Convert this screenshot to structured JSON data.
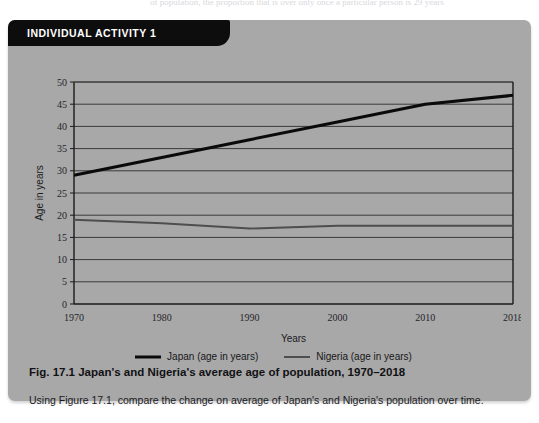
{
  "page": {
    "bleed_text": "of population, the proportion that is over only once a particular person is 29 years"
  },
  "activity": {
    "banner_label": "INDIVIDUAL ACTIVITY 1",
    "caption": "Fig. 17.1 Japan's and Nigeria's average age of population, 1970–2018",
    "instruction": "Using Figure 17.1, compare the change on average of Japan's and Nigeria's population over time."
  },
  "colors": {
    "card_bg": "#a8a8a8",
    "banner_bg": "#0d0d0d",
    "banner_text": "#ffffff",
    "plot_bg": "#a8a8a8",
    "axis_line": "#1a1a1a",
    "gridline": "#3a3a3a",
    "japan_line": "#0a0a0a",
    "nigeria_line": "#4e4e4e",
    "text": "#1b1b1f"
  },
  "chart_data": {
    "type": "line",
    "title": "Fig. 17.1 Japan's and Nigeria's average age of population, 1970–2018",
    "xlabel": "Years",
    "ylabel": "Age in years",
    "x": [
      1970,
      1980,
      1990,
      2000,
      2010,
      2018
    ],
    "categories": [
      "1970",
      "1980",
      "1990",
      "2000",
      "2010",
      "2018"
    ],
    "xtick_labels": [
      "1970",
      "1980",
      "1990",
      "2000",
      "2010",
      "2018"
    ],
    "ytick_labels": [
      "0",
      "5",
      "10",
      "15",
      "20",
      "25",
      "30",
      "35",
      "40",
      "45",
      "50"
    ],
    "yticks": [
      0,
      5,
      10,
      15,
      20,
      25,
      30,
      35,
      40,
      45,
      50
    ],
    "ylim": [
      0,
      50
    ],
    "grid": true,
    "legend_position": "bottom",
    "series": [
      {
        "name": "Japan (age in years)",
        "legend_label": "Japan (age in years)",
        "color": "#0a0a0a",
        "line_width": 3,
        "values": [
          29,
          33,
          37,
          41,
          45,
          47
        ]
      },
      {
        "name": "Nigeria (age in years)",
        "legend_label": "Nigeria (age in years)",
        "color": "#4e4e4e",
        "line_width": 2,
        "values": [
          19,
          18.2,
          17,
          17.6,
          17.6,
          17.6
        ]
      }
    ]
  }
}
